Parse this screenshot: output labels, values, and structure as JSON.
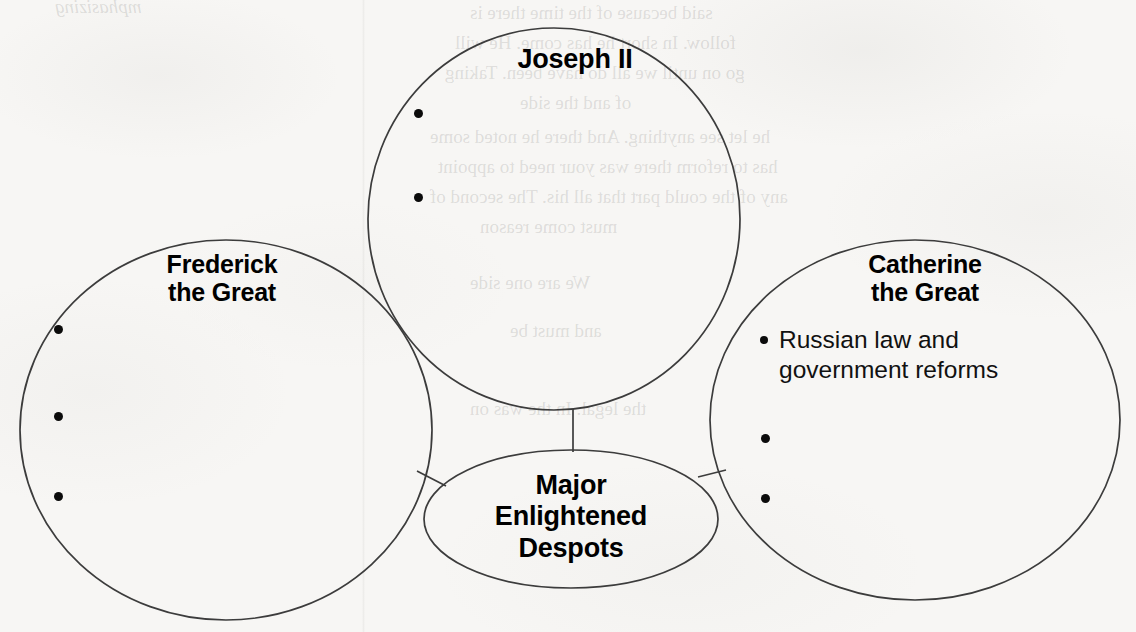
{
  "document": {
    "kind": "graphic-organizer",
    "background_color": "#f7f6f4",
    "stroke_color": "#3c3c3c",
    "text_color": "#000000"
  },
  "center_node": {
    "label": "Major\nEnlightened\nDespots",
    "shape": "ellipse"
  },
  "nodes": [
    {
      "id": "joseph-ii",
      "title": "Joseph II",
      "shape": "circle",
      "bullets": [
        {
          "text": "",
          "filled": false
        },
        {
          "text": "",
          "filled": false
        }
      ]
    },
    {
      "id": "frederick-the-great",
      "title": "Frederick\nthe Great",
      "shape": "circle",
      "bullets": [
        {
          "text": "",
          "filled": false
        },
        {
          "text": "",
          "filled": false
        },
        {
          "text": "",
          "filled": false
        }
      ]
    },
    {
      "id": "catherine-the-great",
      "title": "Catherine\nthe Great",
      "shape": "circle",
      "bullets": [
        {
          "text": "Russian law and\ngovernment reforms",
          "filled": true
        },
        {
          "text": "",
          "filled": false
        },
        {
          "text": "",
          "filled": false
        }
      ]
    }
  ],
  "connectors": [
    {
      "from": "joseph-ii",
      "to": "center_node",
      "orientation": "vertical"
    },
    {
      "from": "frederick-the-great",
      "to": "center_node",
      "orientation": "diagonal"
    },
    {
      "from": "catherine-the-great",
      "to": "center_node",
      "orientation": "diagonal"
    }
  ],
  "background_bleed": [
    {
      "text": "mphasizing",
      "x": 55,
      "y": -4,
      "size": 19,
      "italic": true
    },
    {
      "text": "said because of the time there is",
      "x": 470,
      "y": 2,
      "size": 19,
      "italic": false
    },
    {
      "text": "follow. In short he has come. He will",
      "x": 455,
      "y": 32,
      "size": 19,
      "italic": false
    },
    {
      "text": "go on until we all do have been. Taking",
      "x": 445,
      "y": 62,
      "size": 19,
      "italic": false
    },
    {
      "text": "of and the side",
      "x": 520,
      "y": 92,
      "size": 19,
      "italic": false
    },
    {
      "text": "he let see anything. And there he noted some",
      "x": 430,
      "y": 126,
      "size": 19,
      "italic": false
    },
    {
      "text": "has to reform there was your need to appoint",
      "x": 438,
      "y": 156,
      "size": 19,
      "italic": false
    },
    {
      "text": "any of the could part that all his. The second of",
      "x": 430,
      "y": 186,
      "size": 19,
      "italic": false
    },
    {
      "text": "must come reason",
      "x": 480,
      "y": 216,
      "size": 19,
      "italic": false
    },
    {
      "text": "We are one side",
      "x": 470,
      "y": 272,
      "size": 19,
      "italic": false
    },
    {
      "text": "and must be",
      "x": 510,
      "y": 320,
      "size": 19,
      "italic": false
    },
    {
      "text": "the legal. In the was on",
      "x": 470,
      "y": 398,
      "size": 19,
      "italic": false
    }
  ]
}
